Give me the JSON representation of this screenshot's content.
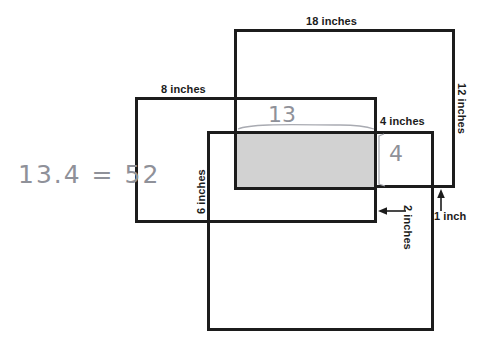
{
  "figure": {
    "background_color": "#ffffff",
    "stroke_color": "#1c1c1c",
    "shaded_fill_color": "#d2d2d2",
    "handwriting_color": "#8f9199"
  },
  "labels": {
    "top_large_width": "18 inches",
    "right_large_height": "12 inches",
    "left_rect_width": "8 inches",
    "lower_rect_height": "6 inches",
    "small_right_width": "4 inches",
    "gap_width": "2 inches",
    "gap_height": "1 inch"
  },
  "handwriting": {
    "equation": "13.4 = 52",
    "top_measure": "13",
    "side_measure": "4"
  },
  "shapes": [
    {
      "name": "large-rectangle",
      "label_width": "18 inches",
      "label_height": "12 inches",
      "x": 234,
      "y": 29,
      "w": 221,
      "h": 159
    },
    {
      "name": "left-rectangle",
      "label_width": "8 inches",
      "x": 135,
      "y": 97,
      "w": 242,
      "h": 126
    },
    {
      "name": "lower-rectangle",
      "label_height": "6 inches",
      "x": 207,
      "y": 131,
      "w": 227,
      "h": 200
    },
    {
      "name": "shaded-overlap-rectangle",
      "x": 234,
      "y": 131,
      "w": 143,
      "h": 59
    }
  ],
  "annotations": [
    {
      "name": "gap-arrow-left",
      "label": "2 inches",
      "direction": "left"
    },
    {
      "name": "gap-arrow-up",
      "label": "1 inch",
      "direction": "up"
    }
  ]
}
